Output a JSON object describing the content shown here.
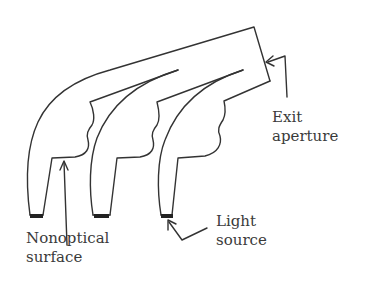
{
  "diagram": {
    "labels": {
      "exit_aperture": {
        "line1": "Exit",
        "line2": "aperture"
      },
      "nonoptical_surface": {
        "line1": "Nonoptical",
        "line2": "surface"
      },
      "light_source": {
        "line1": "Light",
        "line2": "source"
      }
    },
    "legs_count": 3,
    "colors": {
      "stroke": "#333333",
      "source_fill": "#222222",
      "text": "#3a3a3a"
    }
  }
}
